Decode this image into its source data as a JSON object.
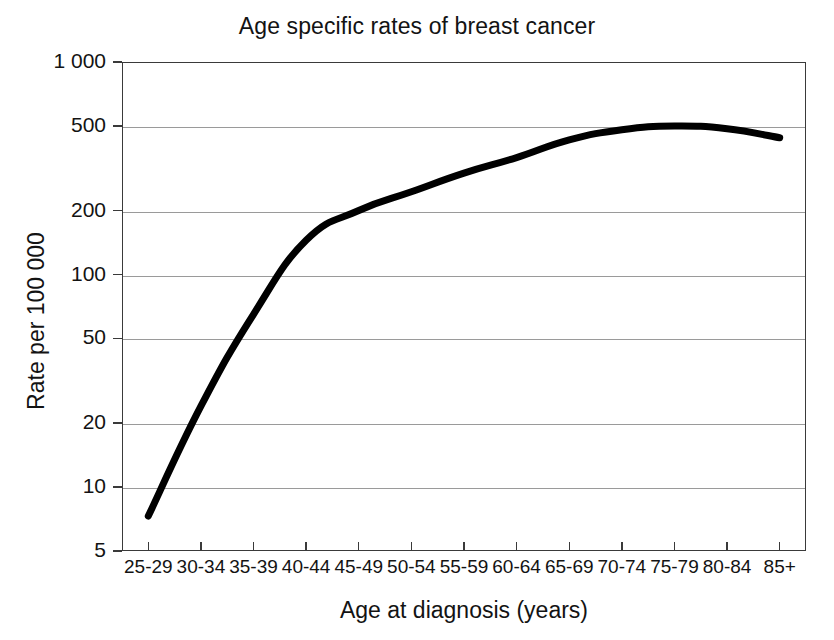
{
  "chart_data": {
    "type": "line",
    "title": "Age specific rates of breast cancer",
    "xlabel": "Age at diagnosis (years)",
    "ylabel": "Rate per 100 000",
    "yscale": "log",
    "ylim": [
      5,
      1000
    ],
    "grid": true,
    "legend": "none",
    "line_color": "#000000",
    "line_width": 7,
    "categories": [
      "25-29",
      "30-34",
      "35-39",
      "40-44",
      "45-49",
      "50-54",
      "55-59",
      "60-64",
      "65-69",
      "70-74",
      "75-79",
      "80-84",
      "85+"
    ],
    "series": [
      {
        "name": "Rate per 100 000",
        "values": [
          7.3,
          24,
          65,
          145,
          200,
          245,
          300,
          355,
          430,
          480,
          500,
          485,
          440
        ]
      }
    ],
    "ytick_labels": [
      "1 000",
      "500",
      "200",
      "100",
      "50",
      "20",
      "10",
      "5"
    ],
    "ytick_values": [
      1000,
      500,
      200,
      100,
      50,
      20,
      10,
      5
    ]
  }
}
